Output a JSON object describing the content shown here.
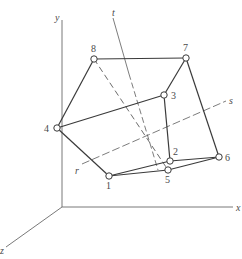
{
  "diagram": {
    "axes": {
      "origin": [
        62,
        207
      ],
      "x": {
        "label": "x",
        "end": [
          233,
          207
        ],
        "label_pos": [
          236,
          211
        ]
      },
      "y": {
        "label": "y",
        "end": [
          62,
          20
        ],
        "label_pos": [
          55,
          21
        ]
      },
      "z": {
        "label": "z",
        "end": [
          6,
          247
        ],
        "label_pos": [
          0,
          254
        ]
      }
    },
    "vertices": [
      {
        "id": "1",
        "label": "1",
        "pos": [
          109,
          176
        ],
        "label_pos": [
          106,
          189
        ]
      },
      {
        "id": "2",
        "label": "2",
        "pos": [
          170,
          161
        ],
        "label_pos": [
          173,
          155
        ]
      },
      {
        "id": "3",
        "label": "3",
        "pos": [
          164,
          95
        ],
        "label_pos": [
          171,
          99
        ]
      },
      {
        "id": "4",
        "label": "4",
        "pos": [
          57,
          128
        ],
        "label_pos": [
          44,
          132
        ]
      },
      {
        "id": "5",
        "label": "5",
        "pos": [
          168,
          170
        ],
        "label_pos": [
          165,
          183
        ]
      },
      {
        "id": "6",
        "label": "6",
        "pos": [
          219,
          157
        ],
        "label_pos": [
          225,
          161
        ]
      },
      {
        "id": "7",
        "label": "7",
        "pos": [
          186,
          58
        ],
        "label_pos": [
          183,
          51
        ]
      },
      {
        "id": "8",
        "label": "8",
        "pos": [
          94,
          59
        ],
        "label_pos": [
          91,
          52
        ]
      }
    ],
    "solid_edges": [
      [
        "4",
        "8"
      ],
      [
        "8",
        "7"
      ],
      [
        "7",
        "3"
      ],
      [
        "7",
        "6"
      ],
      [
        "4",
        "3"
      ],
      [
        "3",
        "2"
      ],
      [
        "2",
        "6"
      ],
      [
        "4",
        "1"
      ],
      [
        "1",
        "2"
      ],
      [
        "1",
        "5"
      ],
      [
        "5",
        "6"
      ]
    ],
    "dashed_edges": [
      [
        "8",
        "5"
      ]
    ],
    "lines": [
      {
        "name": "t",
        "label": "t",
        "from": [
          113,
          18
        ],
        "to": [
          158,
          170
        ],
        "label_pos": [
          112,
          16
        ],
        "solid_until": [
          129,
          74
        ]
      },
      {
        "name": "s",
        "label": "s",
        "from": [
          82,
          164
        ],
        "to": [
          226,
          101
        ],
        "label_pos": [
          229,
          104
        ]
      },
      {
        "name": "r",
        "label": "r",
        "label_pos": [
          75,
          174
        ]
      }
    ],
    "colors": {
      "stroke": "#3a3a3a",
      "axis": "#6a6a6a",
      "dash": "#5a5a5a",
      "vertex_fill": "#ffffff"
    }
  }
}
